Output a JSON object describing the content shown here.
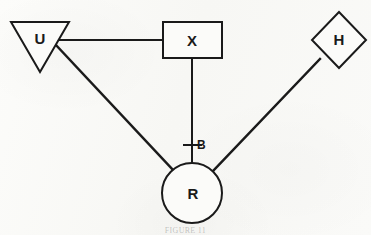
{
  "figure": {
    "caption": "FIGURE 11",
    "background_color": "#fbfbf9",
    "stroke_color": "#1a1a1a"
  },
  "nodes": [
    {
      "id": "U",
      "label": "U",
      "shape": "triangle-down",
      "name": "node-u-triangle",
      "label_left": 32,
      "label_top": 31,
      "label_width": 16
    },
    {
      "id": "X",
      "label": "X",
      "shape": "rectangle",
      "name": "node-x-rectangle",
      "label_left": 184,
      "label_top": 33,
      "label_width": 16
    },
    {
      "id": "H",
      "label": "H",
      "shape": "diamond",
      "name": "node-h-diamond",
      "label_left": 331,
      "label_top": 32,
      "label_width": 16
    },
    {
      "id": "R",
      "label": "R",
      "shape": "circle",
      "name": "node-r-circle",
      "label_left": 185,
      "label_top": 186,
      "label_width": 16
    }
  ],
  "edges": [
    {
      "from": "U",
      "to": "X",
      "name": "edge-u-x",
      "style": "straight"
    },
    {
      "from": "U",
      "to": "R",
      "name": "edge-u-r",
      "style": "straight"
    },
    {
      "from": "X",
      "to": "R",
      "name": "edge-x-r",
      "style": "tick-annotated"
    },
    {
      "from": "H",
      "to": "R",
      "name": "edge-h-r",
      "style": "straight"
    }
  ],
  "edge_labels": [
    {
      "text": "B",
      "on_edge": "edge-x-r",
      "name": "edge-label-b",
      "left": 197,
      "top": 139
    }
  ]
}
